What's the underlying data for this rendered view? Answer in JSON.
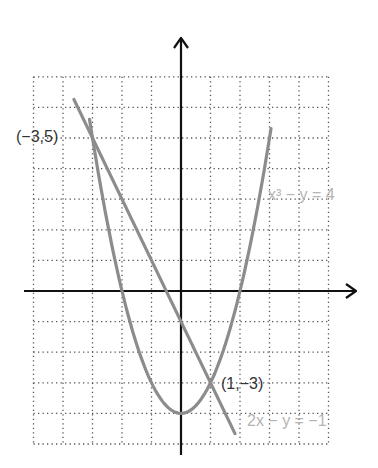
{
  "chart_data": {
    "type": "line",
    "title": "",
    "xlabel": "",
    "ylabel": "",
    "xlim": [
      -5,
      5
    ],
    "ylim": [
      -5,
      7
    ],
    "grid": true,
    "grid_style": "dotted",
    "series": [
      {
        "name": "x³ − y = 4",
        "label": "x³ − y = 4",
        "kind": "parabola",
        "equation_plotted": "y = x^2 - 4",
        "x": [
          -3.1,
          -3,
          -2,
          -1,
          0,
          1,
          2,
          3,
          3.05
        ],
        "y": [
          5.61,
          5,
          0,
          -3,
          -4,
          -3,
          0,
          5,
          5.3
        ],
        "color": "#8c8c8c",
        "label_pos": [
          3.1,
          3.1
        ]
      },
      {
        "name": "2x − y = −1",
        "label": "2x − y = −1",
        "kind": "line",
        "equation_plotted": "y = -2x - 1",
        "x": [
          -3.63,
          1.83
        ],
        "y": [
          6.26,
          -4.66
        ],
        "color": "#8c8c8c",
        "label_pos": [
          2.15,
          -4.45
        ]
      }
    ],
    "annotations": [
      {
        "text": "(−3,5)",
        "x": -3,
        "y": 5
      },
      {
        "text": "(1,−3)",
        "x": 1,
        "y": -3
      }
    ]
  },
  "labels": {
    "point_a": "(−3,5)",
    "point_b": "(1,−3)",
    "eq_parabola": "x³ − y = 4",
    "eq_line": "2x − y = −1"
  },
  "colors": {
    "axis": "#111111",
    "grid": "#555555",
    "curve": "#8c8c8c",
    "eq_label": "#b4b4b4",
    "point_label": "#333333"
  }
}
